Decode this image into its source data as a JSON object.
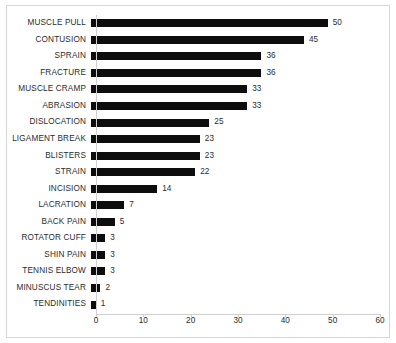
{
  "chart_data": {
    "type": "bar",
    "orientation": "horizontal",
    "title": "",
    "xlabel": "",
    "ylabel": "",
    "xlim": [
      0,
      60
    ],
    "xticks": [
      0,
      10,
      20,
      30,
      40,
      50,
      60
    ],
    "grid": false,
    "legend": false,
    "bar_color": "#0d0d0d",
    "show_value_labels": true,
    "categories": [
      "MUSCLE PULL",
      "CONTUSION",
      "SPRAIN",
      "FRACTURE",
      "MUSCLE CRAMP",
      "ABRASION",
      "DISLOCATION",
      "LIGAMENT BREAK",
      "BLISTERS",
      "STRAIN",
      "INCISION",
      "LACRATION",
      "BACK PAIN",
      "ROTATOR CUFF",
      "SHIN PAIN",
      "TENNIS ELBOW",
      "MINUSCUS TEAR",
      "TENDINITIES"
    ],
    "values": [
      50,
      45,
      36,
      36,
      33,
      33,
      25,
      23,
      23,
      22,
      14,
      7,
      5,
      3,
      3,
      3,
      2,
      1
    ]
  }
}
